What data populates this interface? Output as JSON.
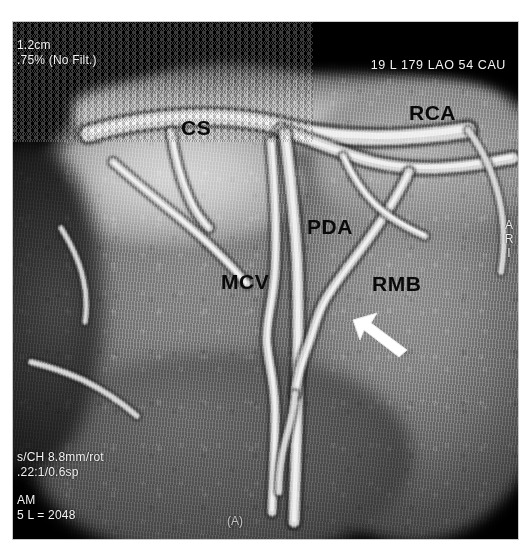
{
  "study": {
    "modality_note": "Cardiac CT angiography volume-rendered reconstruction"
  },
  "overlay": {
    "top_left": "1.2cm\n.75% (No Filt.)",
    "top_right": "19 L 179 LAO 54 CAU",
    "bottom_left_block1": "s/CH 8.8mm/rot\n.22:1/0.6sp",
    "bottom_left_block2": "AM\n5 L = 2048",
    "right_edge_orientation": "A\nR\nI",
    "bottom_center": "(A)"
  },
  "annotations": {
    "labels": [
      {
        "id": "cs",
        "text": "CS",
        "meaning": "coronary sinus"
      },
      {
        "id": "rca",
        "text": "RCA",
        "meaning": "right coronary artery"
      },
      {
        "id": "pda",
        "text": "PDA",
        "meaning": "posterior descending artery"
      },
      {
        "id": "mcv",
        "text": "MCV",
        "meaning": "middle cardiac vein"
      },
      {
        "id": "rmb",
        "text": "RMB",
        "meaning": "right marginal branch"
      }
    ],
    "arrow": {
      "name": "white-pointer-arrow",
      "color": "#ffffff",
      "direction": "up-left"
    }
  },
  "colors": {
    "background": "#ffffff",
    "image_background": "#000000",
    "overlay_text": "#f2f2f2",
    "label_text": "#0a0a0a",
    "arrow": "#ffffff"
  }
}
